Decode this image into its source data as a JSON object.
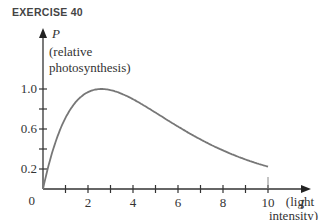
{
  "header": {
    "title": "EXERCISE 40"
  },
  "chart_data": {
    "type": "line",
    "title": "EXERCISE 40",
    "ylabel": "P",
    "ylabel_sub": [
      "(relative",
      "photosynthesis)"
    ],
    "xlabel": "I",
    "xlabel_sub": [
      "(light",
      "intensity)"
    ],
    "origin_label": "0",
    "x_tick_labels": [
      "2",
      "4",
      "6",
      "8",
      "10"
    ],
    "x_ticks": [
      1,
      2,
      3,
      4,
      5,
      6,
      7,
      8,
      9,
      10
    ],
    "y_tick_labels": [
      "0.2",
      "0.6",
      "1.0"
    ],
    "y_ticks": [
      0.2,
      0.4,
      0.6,
      0.8,
      1.0
    ],
    "xlim": [
      0,
      10.9
    ],
    "ylim": [
      0,
      1.3
    ],
    "grid": false,
    "series": [
      {
        "name": "P(I)",
        "x": [
          0,
          0.5,
          1,
          1.5,
          2,
          2.5,
          3,
          3.5,
          4,
          5,
          6,
          7,
          8,
          9,
          10
        ],
        "y": [
          0,
          0.45,
          0.74,
          0.9,
          0.98,
          1.0,
          0.98,
          0.94,
          0.88,
          0.74,
          0.59,
          0.44,
          0.31,
          0.2,
          0.12
        ]
      }
    ]
  }
}
